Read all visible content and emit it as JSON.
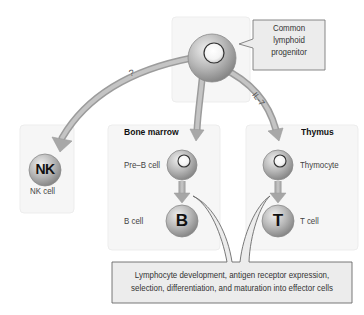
{
  "diagram": {
    "progenitor": {
      "label_lines": [
        "Common",
        "lymphoid",
        "progenitor"
      ]
    },
    "edges": {
      "to_nk_label": "?",
      "to_thymus_label": "IL-7"
    },
    "compartments": {
      "nk": {
        "cell_letter": "NK",
        "cell_label": "NK cell"
      },
      "bone_marrow": {
        "title": "Bone marrow",
        "precursor_label": "Pre–B cell",
        "mature_letter": "B",
        "mature_label": "B cell"
      },
      "thymus": {
        "title": "Thymus",
        "precursor_label": "Thymocyte",
        "mature_letter": "T",
        "mature_label": "T cell"
      }
    },
    "summary": {
      "line1": "Lymphocyte development, antigen receptor expression,",
      "line2": "selection, differentiation, and maturation into effector cells"
    },
    "colors": {
      "box_fill": "#f6f6f6",
      "box_border": "#ececec",
      "arrow": "#a9a9a9",
      "callout_fill": "#ececec",
      "callout_border": "#777777",
      "cell_light": "#e2e2e2",
      "cell_dark": "#8e8e8e"
    }
  }
}
